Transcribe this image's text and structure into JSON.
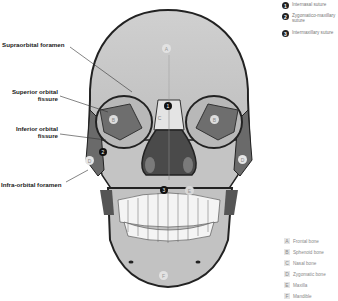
{
  "labels": {
    "supraorbital_foramen": "Supraorbital foramen",
    "superior_orbital_fissure": [
      "Superior orbital",
      "fissure"
    ],
    "inferior_orbital_fissure": [
      "Inferior orbital",
      "fissure"
    ],
    "infraorbital_foramen": "Infra-orbital foramen"
  },
  "sutures_key": [
    {
      "num": "1",
      "label": "Internasal suture"
    },
    {
      "num": "2",
      "label": "Zygomatico-maxillary suture"
    },
    {
      "num": "3",
      "label": "Intermaxillary suture"
    }
  ],
  "bones_legend": [
    {
      "letter": "A",
      "label": "Frontal bone"
    },
    {
      "letter": "B",
      "label": "Sphenoid bone"
    },
    {
      "letter": "C",
      "label": "Nasal bone"
    },
    {
      "letter": "D",
      "label": "Zygomatic bone"
    },
    {
      "letter": "E",
      "label": "Maxilla"
    },
    {
      "letter": "F",
      "label": "Mandible"
    }
  ],
  "markers": {
    "A": "A",
    "B": "B",
    "C": "C",
    "D": "D",
    "E": "E",
    "F": "F",
    "n1": "1",
    "n2": "2",
    "n3": "3"
  }
}
